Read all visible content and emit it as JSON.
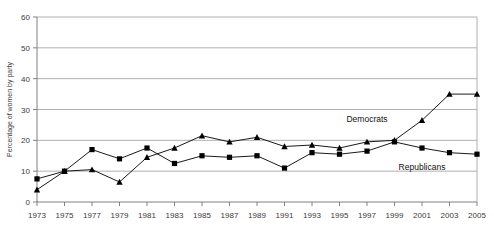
{
  "chart_data": {
    "type": "line",
    "title": "",
    "xlabel": "",
    "ylabel": "Percentage of women by party",
    "ylim": [
      0,
      60
    ],
    "ytick_step": 10,
    "grid": true,
    "grid_axis": "y",
    "legend_position": "inline-annotation",
    "categories": [
      "1973",
      "1975",
      "1977",
      "1979",
      "1981",
      "1983",
      "1985",
      "1987",
      "1989",
      "1991",
      "1993",
      "1995",
      "1997",
      "1999",
      "2001",
      "2003",
      "2005"
    ],
    "yticks": [
      "0",
      "10",
      "20",
      "30",
      "40",
      "50",
      "60"
    ],
    "series": [
      {
        "name": "Democrats",
        "marker": "triangle",
        "color": "#000000",
        "values": [
          4,
          10,
          10.5,
          6.5,
          14.5,
          17.5,
          21.5,
          19.5,
          21,
          18,
          18.5,
          17.5,
          19.5,
          20,
          26.5,
          35,
          35
        ]
      },
      {
        "name": "Republicans",
        "marker": "square",
        "color": "#000000",
        "values": [
          7.5,
          10,
          17,
          14,
          17.5,
          12.5,
          15,
          14.5,
          15,
          11,
          16,
          15.5,
          16.5,
          19.5,
          17.5,
          16,
          15.5
        ]
      }
    ],
    "annotations": [
      {
        "text": "Democrats",
        "x_category": "1997",
        "value": 26
      },
      {
        "text": "Republicans",
        "x_category": "2001",
        "value": 10.5
      }
    ]
  },
  "axis": {
    "y_title": "Percentage of women by party"
  }
}
